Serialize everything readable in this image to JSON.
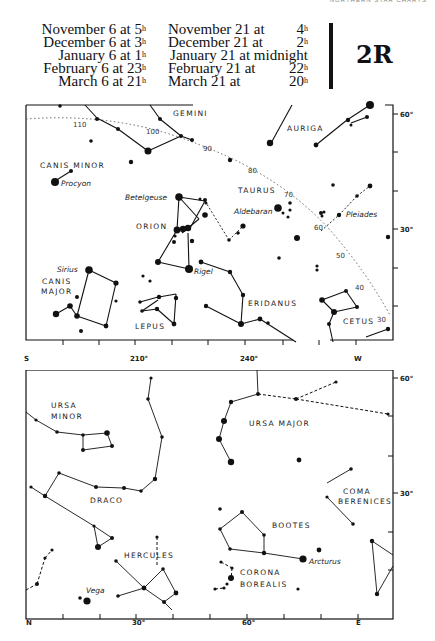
{
  "running_head": "NORTHERN STAR CHARTS",
  "chart_number": "2R",
  "times_col1": [
    {
      "label": "November 6 at ",
      "hour": "5",
      "unit": "h"
    },
    {
      "label": "December 6 at ",
      "hour": "3",
      "unit": "h"
    },
    {
      "label": "January 6 at ",
      "hour": "1",
      "unit": "h"
    },
    {
      "label": "February 6 at ",
      "hour": "23",
      "unit": "h"
    },
    {
      "label": "March 6 at ",
      "hour": "21",
      "unit": "h"
    }
  ],
  "times_col2": [
    {
      "label": "November 21 at",
      "hour": "4",
      "unit": "h"
    },
    {
      "label": "December 21 at",
      "hour": "2",
      "unit": "h"
    },
    {
      "label": "January 21 at midnight",
      "hour": "",
      "unit": ""
    },
    {
      "label": "February 21 at",
      "hour": "22",
      "unit": "h"
    },
    {
      "label": "March 21 at",
      "hour": "20",
      "unit": "h"
    }
  ],
  "upper_chart": {
    "direction_left": "S",
    "direction_right": "W",
    "x_ticks": [
      "210°",
      "240°"
    ],
    "y_ticks": [
      "60°",
      "30°"
    ],
    "ecliptic_marks": [
      "110",
      "100",
      "90",
      "80",
      "70",
      "60",
      "50",
      "40",
      "30"
    ],
    "constellations": [
      "GEMINI",
      "AURIGA",
      "CANIS MINOR",
      "TAURUS",
      "ORION",
      "CANIS",
      "MAJOR",
      "ERIDANUS",
      "LEPUS",
      "CETUS"
    ],
    "stars": [
      "Procyon",
      "Betelgeuse",
      "Aldebaran",
      "Pleiades",
      "Sirius",
      "Rigel"
    ]
  },
  "lower_chart": {
    "direction_left": "N",
    "direction_right": "E",
    "x_ticks": [
      "30°",
      "60°"
    ],
    "y_ticks": [
      "60°",
      "30°"
    ],
    "constellations": [
      "URSA",
      "MINOR",
      "URSA MAJOR",
      "DRACO",
      "COMA",
      "BERENICES",
      "BOOTES",
      "HERCULES",
      "CORONA",
      "BOREALIS"
    ],
    "stars": [
      "Arcturus",
      "Vega"
    ]
  }
}
